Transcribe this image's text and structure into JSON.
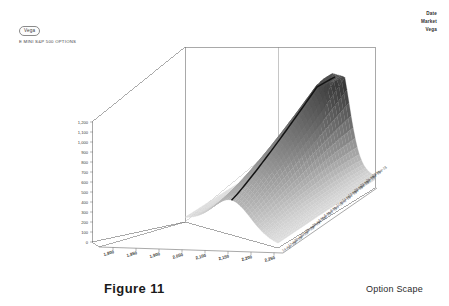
{
  "header": {
    "vega_chip": "Vega",
    "instrument": "E MINI S&P 500 OPTIONS",
    "legend": [
      "Date",
      "Market",
      "Vega"
    ]
  },
  "captions": {
    "figure": "Figure 11",
    "title": "Option Scape"
  },
  "chart_data": {
    "type": "surface",
    "title": "Option Scape",
    "subtitle": "E MINI S&P 500 OPTIONS",
    "zlabel": "Vega",
    "xlabel": "Market",
    "ylabel": "Date",
    "grid": true,
    "legend_position": "top-right",
    "legend_entries": [
      "Date",
      "Market",
      "Vega"
    ],
    "zlim": [
      0,
      1200
    ],
    "z_ticks": [
      "1,200",
      "1,100",
      "1,000",
      "900",
      "800",
      "700",
      "600",
      "500",
      "400",
      "300",
      "200",
      "100",
      "0"
    ],
    "z_tick_values": [
      1200,
      1100,
      1000,
      900,
      800,
      700,
      600,
      500,
      400,
      300,
      200,
      100,
      0
    ],
    "x_ticks": [
      "1,800",
      "1,850",
      "1,900",
      "2,050",
      "2,100",
      "2,150",
      "2,200",
      "2,250"
    ],
    "x_tick_values": [
      1800,
      1850,
      1900,
      2050,
      2100,
      2150,
      2200,
      2250
    ],
    "y_ticks": [
      "14-Apr-15",
      "17-Apr-15",
      "20-Apr-15",
      "23-Apr-15",
      "26-Apr-15",
      "29-Apr-15",
      "2-May-15",
      "5-May-15",
      "8-May-15",
      "11-May-15",
      "14-May-15",
      "17-May-15",
      "20-May-15",
      "23-May-15",
      "26-May-15",
      "29-May-15"
    ],
    "annotations": [
      "at-the-money vega ridge curve"
    ],
    "surface": {
      "peak_z": 1200,
      "peak_x": 2050,
      "description": "Vega surface ridge peaking near the at-the-money strike and decaying toward wings and toward expiry"
    }
  }
}
